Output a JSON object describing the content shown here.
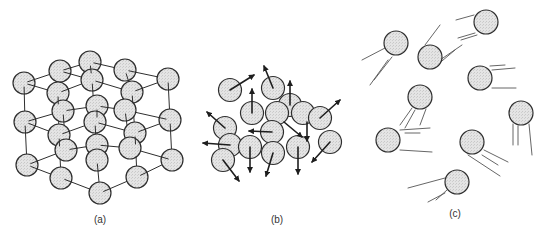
{
  "colors": {
    "particle_fill": "#e2e2e2",
    "particle_stroke": "#2e2e2e",
    "line": "#2e2e2e",
    "streak": "#555555"
  },
  "panels": [
    {
      "id": "a",
      "label": "(a)",
      "label_pos": [
        100,
        214
      ],
      "description": "crystalline solid lattice",
      "radius": 11,
      "particles": [
        [
          90,
          62
        ],
        [
          60,
          71
        ],
        [
          125,
          70
        ],
        [
          168,
          79
        ],
        [
          24,
          83
        ],
        [
          92,
          80
        ],
        [
          58,
          93
        ],
        [
          132,
          92
        ],
        [
          97,
          106
        ],
        [
          63,
          111
        ],
        [
          125,
          110
        ],
        [
          25,
          122
        ],
        [
          95,
          122
        ],
        [
          170,
          120
        ],
        [
          59,
          135
        ],
        [
          135,
          133
        ],
        [
          97,
          145
        ],
        [
          66,
          150
        ],
        [
          130,
          148
        ],
        [
          27,
          165
        ],
        [
          97,
          160
        ],
        [
          172,
          160
        ],
        [
          61,
          178
        ],
        [
          137,
          177
        ],
        [
          100,
          193
        ]
      ],
      "bonds": [
        [
          [
            24,
            83
          ],
          [
            60,
            71
          ]
        ],
        [
          [
            60,
            71
          ],
          [
            90,
            62
          ]
        ],
        [
          [
            90,
            62
          ],
          [
            125,
            70
          ]
        ],
        [
          [
            125,
            70
          ],
          [
            168,
            79
          ]
        ],
        [
          [
            24,
            83
          ],
          [
            58,
            93
          ]
        ],
        [
          [
            58,
            93
          ],
          [
            92,
            80
          ]
        ],
        [
          [
            92,
            80
          ],
          [
            132,
            92
          ]
        ],
        [
          [
            132,
            92
          ],
          [
            168,
            79
          ]
        ],
        [
          [
            60,
            71
          ],
          [
            92,
            80
          ]
        ],
        [
          [
            90,
            62
          ],
          [
            92,
            80
          ]
        ],
        [
          [
            125,
            70
          ],
          [
            132,
            92
          ]
        ],
        [
          [
            24,
            83
          ],
          [
            25,
            122
          ]
        ],
        [
          [
            25,
            122
          ],
          [
            27,
            165
          ]
        ],
        [
          [
            168,
            79
          ],
          [
            170,
            120
          ]
        ],
        [
          [
            170,
            120
          ],
          [
            172,
            160
          ]
        ],
        [
          [
            58,
            93
          ],
          [
            59,
            135
          ]
        ],
        [
          [
            59,
            135
          ],
          [
            61,
            178
          ]
        ],
        [
          [
            92,
            80
          ],
          [
            95,
            122
          ]
        ],
        [
          [
            95,
            122
          ],
          [
            97,
            160
          ]
        ],
        [
          [
            97,
            160
          ],
          [
            100,
            193
          ]
        ],
        [
          [
            132,
            92
          ],
          [
            135,
            133
          ]
        ],
        [
          [
            135,
            133
          ],
          [
            137,
            177
          ]
        ],
        [
          [
            25,
            122
          ],
          [
            59,
            135
          ]
        ],
        [
          [
            59,
            135
          ],
          [
            95,
            122
          ]
        ],
        [
          [
            95,
            122
          ],
          [
            135,
            133
          ]
        ],
        [
          [
            135,
            133
          ],
          [
            170,
            120
          ]
        ],
        [
          [
            27,
            165
          ],
          [
            61,
            178
          ]
        ],
        [
          [
            61,
            178
          ],
          [
            100,
            193
          ]
        ],
        [
          [
            100,
            193
          ],
          [
            137,
            177
          ]
        ],
        [
          [
            137,
            177
          ],
          [
            172,
            160
          ]
        ],
        [
          [
            63,
            111
          ],
          [
            97,
            106
          ]
        ],
        [
          [
            97,
            106
          ],
          [
            125,
            110
          ]
        ],
        [
          [
            63,
            111
          ],
          [
            66,
            150
          ]
        ],
        [
          [
            125,
            110
          ],
          [
            130,
            148
          ]
        ],
        [
          [
            66,
            150
          ],
          [
            97,
            145
          ]
        ],
        [
          [
            97,
            145
          ],
          [
            130,
            148
          ]
        ],
        [
          [
            97,
            106
          ],
          [
            97,
            145
          ]
        ],
        [
          [
            25,
            122
          ],
          [
            63,
            111
          ]
        ],
        [
          [
            170,
            120
          ],
          [
            125,
            110
          ]
        ],
        [
          [
            27,
            165
          ],
          [
            66,
            150
          ]
        ],
        [
          [
            172,
            160
          ],
          [
            130,
            148
          ]
        ]
      ]
    },
    {
      "id": "b",
      "label": "(b)",
      "label_pos": [
        277,
        214
      ],
      "description": "liquid: closely packed particles with random velocity arrows",
      "radius": 11.5,
      "particles": [
        [
          230,
          90
        ],
        [
          273,
          88
        ],
        [
          290,
          105
        ],
        [
          252,
          113
        ],
        [
          277,
          113
        ],
        [
          303,
          113
        ],
        [
          320,
          118
        ],
        [
          225,
          128
        ],
        [
          272,
          132
        ],
        [
          230,
          145
        ],
        [
          250,
          147
        ],
        [
          273,
          153
        ],
        [
          298,
          147
        ],
        [
          330,
          142
        ],
        [
          223,
          160
        ]
      ],
      "arrows": [
        [
          [
            230,
            90
          ],
          [
            254,
            75
          ]
        ],
        [
          [
            273,
            88
          ],
          [
            264,
            66
          ]
        ],
        [
          [
            290,
            105
          ],
          [
            290,
            81
          ]
        ],
        [
          [
            252,
            113
          ],
          [
            252,
            89
          ]
        ],
        [
          [
            320,
            118
          ],
          [
            340,
            100
          ]
        ],
        [
          [
            225,
            128
          ],
          [
            207,
            112
          ]
        ],
        [
          [
            272,
            132
          ],
          [
            249,
            131
          ]
        ],
        [
          [
            230,
            145
          ],
          [
            203,
            143
          ]
        ],
        [
          [
            250,
            147
          ],
          [
            250,
            172
          ]
        ],
        [
          [
            273,
            153
          ],
          [
            266,
            176
          ]
        ],
        [
          [
            298,
            147
          ],
          [
            298,
            174
          ]
        ],
        [
          [
            330,
            142
          ],
          [
            312,
            162
          ]
        ],
        [
          [
            223,
            160
          ],
          [
            239,
            181
          ]
        ],
        [
          [
            284,
            122
          ],
          [
            302,
            137
          ]
        ],
        [
          [
            307,
            122
          ],
          [
            307,
            141
          ]
        ]
      ]
    },
    {
      "id": "c",
      "label": "(c)",
      "label_pos": [
        455,
        208
      ],
      "description": "gas: widely spaced particles with motion streaks",
      "radius": 12,
      "particles": [
        [
          396,
          43
        ],
        [
          430,
          57
        ],
        [
          486,
          22
        ],
        [
          480,
          78
        ],
        [
          420,
          97
        ],
        [
          521,
          113
        ],
        [
          388,
          140
        ],
        [
          472,
          142
        ],
        [
          457,
          182
        ]
      ],
      "streaks": [
        [
          [
            385,
            48
          ],
          [
            362,
            60
          ]
        ],
        [
          [
            392,
            57
          ],
          [
            374,
            80
          ]
        ],
        [
          [
            388,
            60
          ],
          [
            370,
            85
          ]
        ],
        [
          [
            425,
            45
          ],
          [
            440,
            25
          ]
        ],
        [
          [
            440,
            60
          ],
          [
            462,
            45
          ]
        ],
        [
          [
            436,
            66
          ],
          [
            455,
            50
          ]
        ],
        [
          [
            474,
            15
          ],
          [
            456,
            20
          ]
        ],
        [
          [
            475,
            33
          ],
          [
            458,
            38
          ]
        ],
        [
          [
            477,
            35
          ],
          [
            461,
            40
          ]
        ],
        [
          [
            492,
            70
          ],
          [
            515,
            68
          ]
        ],
        [
          [
            492,
            88
          ],
          [
            516,
            88
          ]
        ],
        [
          [
            490,
            66
          ],
          [
            505,
            65
          ]
        ],
        [
          [
            412,
            108
          ],
          [
            400,
            125
          ]
        ],
        [
          [
            426,
            109
          ],
          [
            420,
            125
          ]
        ],
        [
          [
            415,
            110
          ],
          [
            405,
            128
          ]
        ],
        [
          [
            400,
            130
          ],
          [
            430,
            128
          ]
        ],
        [
          [
            400,
            150
          ],
          [
            432,
            152
          ]
        ],
        [
          [
            405,
            133
          ],
          [
            420,
            133
          ]
        ],
        [
          [
            513,
            124
          ],
          [
            513,
            145
          ]
        ],
        [
          [
            529,
            124
          ],
          [
            532,
            155
          ]
        ],
        [
          [
            518,
            126
          ],
          [
            518,
            145
          ]
        ],
        [
          [
            484,
            150
          ],
          [
            508,
            162
          ]
        ],
        [
          [
            468,
            155
          ],
          [
            500,
            176
          ]
        ],
        [
          [
            482,
            155
          ],
          [
            498,
            165
          ]
        ],
        [
          [
            445,
            178
          ],
          [
            408,
            188
          ]
        ],
        [
          [
            447,
            190
          ],
          [
            436,
            200
          ]
        ],
        [
          [
            445,
            193
          ],
          [
            428,
            202
          ]
        ]
      ]
    }
  ]
}
